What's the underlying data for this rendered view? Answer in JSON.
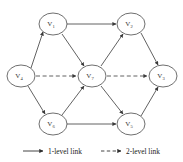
{
  "figure": {
    "type": "directed-graph",
    "background_color": "#ffffff",
    "stroke_color": "#3a3a3a",
    "node_fill": "#ffffff",
    "node_stroke": "#4a4a4a"
  },
  "nodes": [
    {
      "id": "v1",
      "label": "V",
      "subscript": "1",
      "cx": 53,
      "cy": 24,
      "rx": 14,
      "ry": 11
    },
    {
      "id": "v2",
      "label": "V",
      "subscript": "2",
      "cx": 131,
      "cy": 24,
      "rx": 14,
      "ry": 11
    },
    {
      "id": "v3",
      "label": "V",
      "subscript": "3",
      "cx": 163,
      "cy": 76,
      "rx": 14,
      "ry": 11
    },
    {
      "id": "v4",
      "label": "V",
      "subscript": "4",
      "cx": 21,
      "cy": 76,
      "rx": 14,
      "ry": 11
    },
    {
      "id": "v5",
      "label": "V",
      "subscript": "5",
      "cx": 131,
      "cy": 124,
      "rx": 14,
      "ry": 11
    },
    {
      "id": "v6",
      "label": "V",
      "subscript": "6",
      "cx": 53,
      "cy": 124,
      "rx": 14,
      "ry": 11
    },
    {
      "id": "v7",
      "label": "V",
      "subscript": "7",
      "cx": 92,
      "cy": 76,
      "rx": 14,
      "ry": 11
    }
  ],
  "edges": [
    {
      "id": "e-v4-v1",
      "from": "v4",
      "to": "v1",
      "kind": "1-level",
      "style": "solid"
    },
    {
      "id": "e-v1-v2",
      "from": "v1",
      "to": "v2",
      "kind": "1-level",
      "style": "solid"
    },
    {
      "id": "e-v1-v7",
      "from": "v1",
      "to": "v7",
      "kind": "1-level",
      "style": "solid"
    },
    {
      "id": "e-v7-v2",
      "from": "v7",
      "to": "v2",
      "kind": "1-level",
      "style": "solid"
    },
    {
      "id": "e-v2-v3",
      "from": "v2",
      "to": "v3",
      "kind": "1-level",
      "style": "solid"
    },
    {
      "id": "e-v4-v6",
      "from": "v4",
      "to": "v6",
      "kind": "1-level",
      "style": "solid"
    },
    {
      "id": "e-v6-v7",
      "from": "v6",
      "to": "v7",
      "kind": "1-level",
      "style": "solid"
    },
    {
      "id": "e-v6-v5",
      "from": "v6",
      "to": "v5",
      "kind": "1-level",
      "style": "solid"
    },
    {
      "id": "e-v7-v5",
      "from": "v7",
      "to": "v5",
      "kind": "1-level",
      "style": "solid"
    },
    {
      "id": "e-v5-v3",
      "from": "v5",
      "to": "v3",
      "kind": "1-level",
      "style": "solid"
    },
    {
      "id": "e-v4-v7",
      "from": "v4",
      "to": "v7",
      "kind": "2-level",
      "style": "dashed"
    },
    {
      "id": "e-v7-v3",
      "from": "v7",
      "to": "v3",
      "kind": "2-level",
      "style": "dashed"
    }
  ],
  "legend": {
    "items": [
      {
        "id": "legend-1-level",
        "label": "1-level link",
        "style": "solid"
      },
      {
        "id": "legend-2-level",
        "label": "2-level link",
        "style": "dashed"
      }
    ]
  }
}
